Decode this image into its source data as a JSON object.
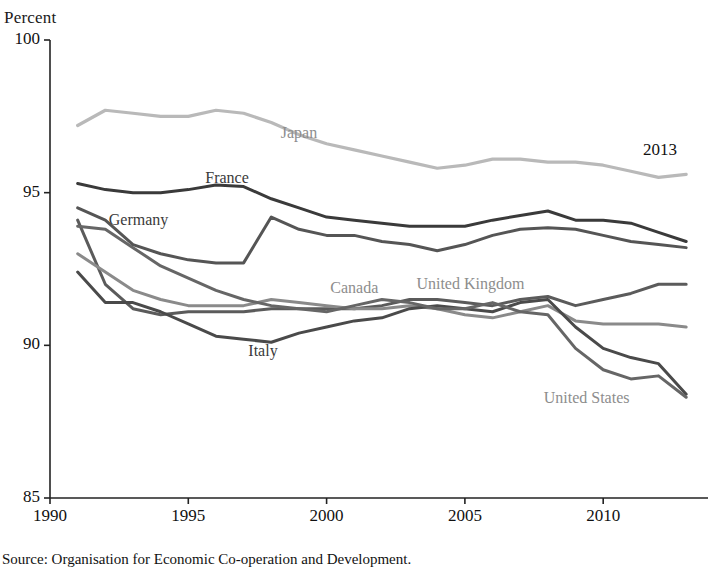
{
  "figure": {
    "unit_label": "Percent",
    "title_partial": "",
    "source": "Source: Organisation for Economic Co-operation and Development.",
    "end_year_annotation": "2013"
  },
  "axes": {
    "y_ticks": [
      "100",
      "95",
      "90",
      "85"
    ],
    "x_ticks": [
      "1990",
      "1995",
      "2000",
      "2005",
      "2010"
    ],
    "ylim": [
      85,
      100
    ],
    "xlim": [
      1990,
      2013.5
    ]
  },
  "colors": {
    "japan": "#b9b9b9",
    "france": "#3a3a3a",
    "germany": "#555555",
    "united_kingdom": "#5b5b5b",
    "canada": "#8a8a8a",
    "italy": "#4a4a4a",
    "united_states": "#666666",
    "axis": "#222222"
  },
  "chart_data": {
    "type": "line",
    "title": "Percent",
    "xlabel": "",
    "ylabel": "Percent",
    "ylim": [
      85,
      100
    ],
    "xlim": [
      1990,
      2013.5
    ],
    "grid": false,
    "legend": "inline-annotations",
    "x": [
      1991,
      1992,
      1993,
      1994,
      1995,
      1996,
      1997,
      1998,
      1999,
      2000,
      2001,
      2002,
      2003,
      2004,
      2005,
      2006,
      2007,
      2008,
      2009,
      2010,
      2011,
      2012,
      2013
    ],
    "series": [
      {
        "name": "Japan",
        "color": "#b9b9b9",
        "label_x": 1999.0,
        "label_y": 96.9,
        "values": [
          97.2,
          97.7,
          97.6,
          97.5,
          97.5,
          97.7,
          97.6,
          97.3,
          96.9,
          96.6,
          96.4,
          96.2,
          96.0,
          95.8,
          95.9,
          96.1,
          96.1,
          96.0,
          96.0,
          95.9,
          95.7,
          95.5,
          95.6
        ]
      },
      {
        "name": "France",
        "color": "#3a3a3a",
        "label_x": 1996.4,
        "label_y": 95.4,
        "values": [
          95.3,
          95.1,
          95.0,
          95.0,
          95.1,
          95.25,
          95.2,
          94.8,
          94.5,
          94.2,
          94.1,
          94.0,
          93.9,
          93.9,
          93.9,
          94.1,
          94.25,
          94.4,
          94.1,
          94.1,
          94.0,
          93.7,
          93.4
        ]
      },
      {
        "name": "Germany",
        "color": "#555555",
        "label_x": 1993.2,
        "label_y": 94.05,
        "values": [
          94.5,
          94.1,
          93.3,
          93.0,
          92.8,
          92.7,
          92.7,
          94.2,
          93.8,
          93.6,
          93.6,
          93.4,
          93.3,
          93.1,
          93.3,
          93.6,
          93.8,
          93.85,
          93.8,
          93.6,
          93.4,
          93.3,
          93.2
        ]
      },
      {
        "name": "United Kingdom",
        "color": "#5b5b5b",
        "label_x": 2005.2,
        "label_y": 91.95,
        "values": [
          94.1,
          92.0,
          91.2,
          91.0,
          91.1,
          91.1,
          91.1,
          91.2,
          91.2,
          91.2,
          91.2,
          91.3,
          91.5,
          91.5,
          91.4,
          91.3,
          91.5,
          91.6,
          91.3,
          91.5,
          91.7,
          92.0,
          92.0
        ]
      },
      {
        "name": "Canada",
        "color": "#8a8a8a",
        "label_x": 2001.0,
        "label_y": 91.8,
        "values": [
          93.0,
          92.4,
          91.8,
          91.5,
          91.3,
          91.3,
          91.3,
          91.5,
          91.4,
          91.3,
          91.2,
          91.2,
          91.3,
          91.2,
          91.0,
          90.9,
          91.1,
          91.3,
          90.8,
          90.7,
          90.7,
          90.7,
          90.6
        ]
      },
      {
        "name": "Italy",
        "color": "#4a4a4a",
        "label_x": 1997.7,
        "label_y": 89.75,
        "values": [
          92.4,
          91.4,
          91.4,
          91.1,
          90.7,
          90.3,
          90.2,
          90.1,
          90.4,
          90.6,
          90.8,
          90.9,
          91.2,
          91.3,
          91.2,
          91.1,
          91.4,
          91.5,
          90.6,
          89.9,
          89.6,
          89.4,
          88.4
        ]
      },
      {
        "name": "United States",
        "color": "#666666",
        "label_x": 2009.4,
        "label_y": 88.2,
        "values": [
          93.9,
          93.8,
          93.2,
          92.6,
          92.2,
          91.8,
          91.5,
          91.3,
          91.2,
          91.1,
          91.3,
          91.5,
          91.4,
          91.2,
          91.2,
          91.4,
          91.1,
          91.0,
          89.9,
          89.2,
          88.9,
          89.0,
          88.3
        ]
      }
    ]
  }
}
